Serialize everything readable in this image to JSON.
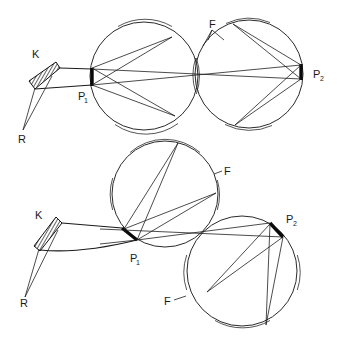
{
  "figure": {
    "panels": [
      {
        "id": "top",
        "labels": {
          "source": "K",
          "receiver": "R",
          "port1": "P",
          "port1_sub": "1",
          "port2": "P",
          "port2_sub": "2",
          "sphere_wall": "F"
        }
      },
      {
        "id": "bottom",
        "labels": {
          "source": "K",
          "receiver": "R",
          "port1": "P",
          "port1_sub": "1",
          "port2": "P",
          "port2_sub": "2",
          "sphere_wall_upper": "F",
          "sphere_wall_lower": "F"
        }
      }
    ],
    "colors": {
      "line": "#1e1e1e",
      "background": "#ffffff"
    }
  }
}
